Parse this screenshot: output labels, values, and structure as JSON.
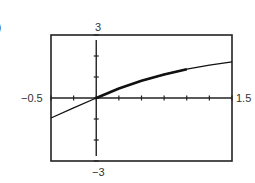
{
  "figure": {
    "part_label": ")",
    "window": {
      "xmin_label": "−0.5",
      "xmax_label": "1.5",
      "ymin_label": "−3",
      "ymax_label": "3"
    },
    "colors": {
      "frame": "#222222",
      "curve": "#111111",
      "background": "#ffffff"
    }
  },
  "chart_data": {
    "type": "line",
    "title": "",
    "xlabel": "",
    "ylabel": "",
    "xlim": [
      -0.5,
      1.5
    ],
    "ylim": [
      -3,
      3
    ],
    "x_tick_step": 0.25,
    "y_tick_step": 1,
    "grid": false,
    "legend": null,
    "tick_labels": {
      "x": [
        "−0.5",
        "1.5"
      ],
      "y": [
        "−3",
        "3"
      ]
    },
    "series": [
      {
        "name": "f(x)",
        "x": [
          -0.5,
          -0.25,
          0,
          0.25,
          0.5,
          0.75,
          1.0,
          1.25,
          1.5
        ],
        "y": [
          -0.95,
          -0.47,
          0,
          0.45,
          0.82,
          1.12,
          1.37,
          1.56,
          1.72
        ]
      }
    ],
    "annotations": [
      "thicker trace segment from x=0 to x≈1.0"
    ]
  }
}
